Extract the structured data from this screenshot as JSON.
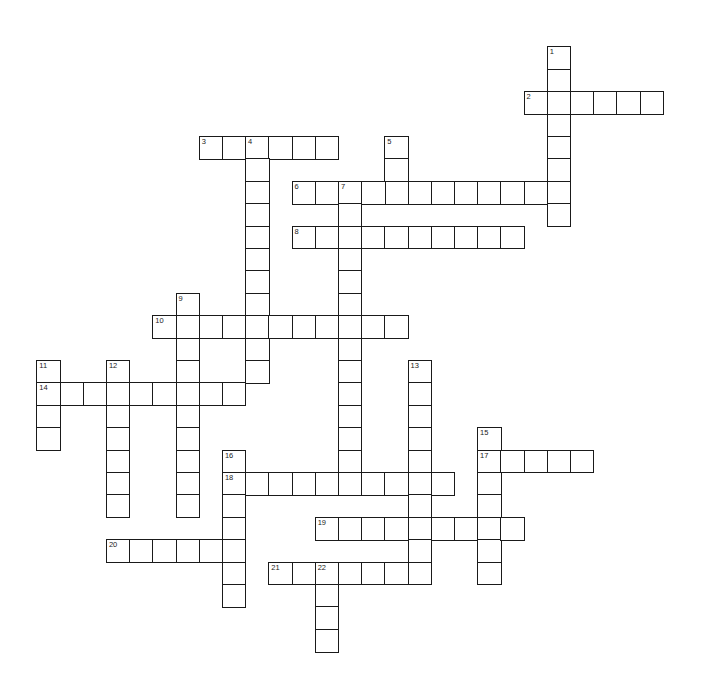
{
  "puzzle": {
    "type": "crossword",
    "grid": {
      "origin_x": 37,
      "origin_y": 47,
      "cell_w": 23.2,
      "cell_h": 22.4
    },
    "entries": [
      {
        "number": "1",
        "direction": "down",
        "row": 0,
        "col": 22,
        "length": 8
      },
      {
        "number": "2",
        "direction": "across",
        "row": 2,
        "col": 21,
        "length": 6
      },
      {
        "number": "3",
        "direction": "across",
        "row": 4,
        "col": 7,
        "length": 6
      },
      {
        "number": "4",
        "direction": "down",
        "row": 4,
        "col": 9,
        "length": 11
      },
      {
        "number": "5",
        "direction": "down",
        "row": 4,
        "col": 15,
        "length": 3
      },
      {
        "number": "6",
        "direction": "across",
        "row": 6,
        "col": 11,
        "length": 12
      },
      {
        "number": "7",
        "direction": "down",
        "row": 6,
        "col": 13,
        "length": 14
      },
      {
        "number": "8",
        "direction": "across",
        "row": 8,
        "col": 11,
        "length": 10
      },
      {
        "number": "9",
        "direction": "down",
        "row": 11,
        "col": 6,
        "length": 10
      },
      {
        "number": "10",
        "direction": "across",
        "row": 12,
        "col": 5,
        "length": 11
      },
      {
        "number": "11",
        "direction": "down",
        "row": 14,
        "col": 0,
        "length": 4
      },
      {
        "number": "12",
        "direction": "down",
        "row": 14,
        "col": 3,
        "length": 7
      },
      {
        "number": "13",
        "direction": "down",
        "row": 14,
        "col": 16,
        "length": 10
      },
      {
        "number": "14",
        "direction": "across",
        "row": 15,
        "col": 0,
        "length": 9
      },
      {
        "number": "15",
        "direction": "down",
        "row": 17,
        "col": 19,
        "length": 7
      },
      {
        "number": "16",
        "direction": "down",
        "row": 18,
        "col": 8,
        "length": 7
      },
      {
        "number": "17",
        "direction": "across",
        "row": 18,
        "col": 19,
        "length": 5
      },
      {
        "number": "18",
        "direction": "across",
        "row": 19,
        "col": 8,
        "length": 10
      },
      {
        "number": "19",
        "direction": "across",
        "row": 21,
        "col": 12,
        "length": 9
      },
      {
        "number": "20",
        "direction": "across",
        "row": 22,
        "col": 3,
        "length": 6
      },
      {
        "number": "21",
        "direction": "across",
        "row": 23,
        "col": 10,
        "length": 7
      },
      {
        "number": "22",
        "direction": "down",
        "row": 23,
        "col": 12,
        "length": 4
      }
    ],
    "colors": {
      "border": "#1a1a1a",
      "cell_fill": "#ffffff",
      "number": "#222222",
      "background": "#ffffff"
    }
  }
}
